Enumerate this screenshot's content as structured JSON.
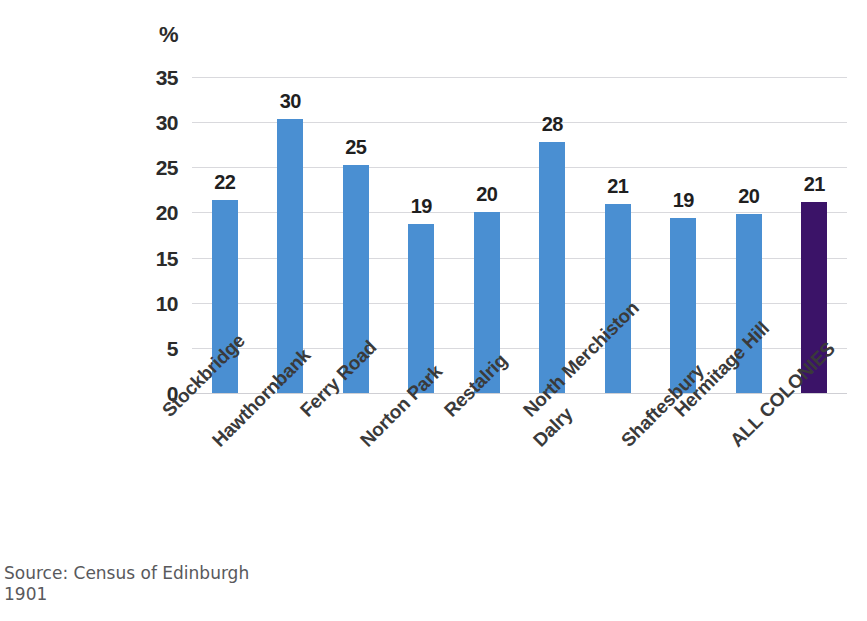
{
  "chart_data": {
    "type": "bar",
    "title": "",
    "subtitle": "",
    "xlabel": "",
    "ylabel": "%",
    "ylim": [
      0,
      35
    ],
    "yticks": [
      0,
      5,
      10,
      15,
      20,
      25,
      30,
      35
    ],
    "ytick_labels": [
      "0",
      "5",
      "10",
      "15",
      "20",
      "25",
      "30",
      "35"
    ],
    "grid": true,
    "legend": "none",
    "categories": [
      "Stockbridge",
      "Hawthornbank",
      "Ferry Road",
      "Norton Park",
      "Restalrig",
      "Dalry",
      "North Merchiston",
      "Shaftesbury",
      "Hermitage Hill",
      "ALL COLONIES"
    ],
    "values": [
      21.4,
      30.3,
      25.3,
      18.7,
      20.1,
      27.8,
      20.9,
      19.4,
      19.8,
      21.2
    ],
    "data_labels": [
      "22",
      "30",
      "25",
      "19",
      "20",
      "28",
      "21",
      "19",
      "20",
      "21"
    ],
    "bar_colors": [
      "#4a8fd2",
      "#4a8fd2",
      "#4a8fd2",
      "#4a8fd2",
      "#4a8fd2",
      "#4a8fd2",
      "#4a8fd2",
      "#4a8fd2",
      "#4a8fd2",
      "#3b1368"
    ],
    "highlight_index": 9,
    "colors": {
      "series_primary": "#4a8fd2",
      "series_highlight": "#3b1368",
      "gridline": "#d9d9dd",
      "text": "#2b2b2b",
      "source_text": "#59595c"
    },
    "annotations": []
  },
  "axis": {
    "unit_label": "%"
  },
  "source": {
    "text": "Source: Census of Edinburgh\n1901"
  }
}
